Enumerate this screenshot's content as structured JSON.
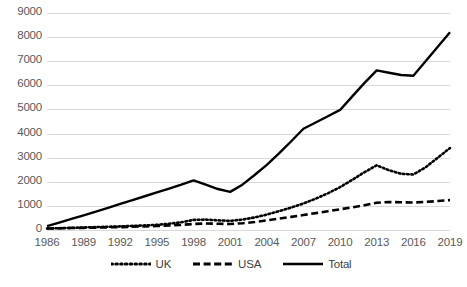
{
  "chart_data": {
    "type": "line",
    "title": "",
    "xlabel": "",
    "ylabel": "",
    "x": [
      1986,
      1987,
      1988,
      1989,
      1990,
      1991,
      1992,
      1993,
      1994,
      1995,
      1996,
      1997,
      1998,
      1999,
      2000,
      2001,
      2002,
      2003,
      2004,
      2005,
      2006,
      2007,
      2008,
      2009,
      2010,
      2011,
      2012,
      2013,
      2014,
      2015,
      2016,
      2017,
      2018,
      2019
    ],
    "xticks": [
      "1986",
      "1989",
      "1992",
      "1995",
      "1998",
      "2001",
      "2004",
      "2007",
      "2010",
      "2013",
      "2016",
      "2019"
    ],
    "yticks": [
      "0",
      "1000",
      "2000",
      "3000",
      "4000",
      "5000",
      "6000",
      "7000",
      "8000",
      "9000"
    ],
    "ylim": [
      0,
      9000
    ],
    "ytick_step": 1000,
    "grid": true,
    "legend_position": "bottom",
    "series": [
      {
        "name": "UK",
        "style": "dotted",
        "color": "#000000",
        "values": [
          60,
          75,
          90,
          105,
          120,
          135,
          150,
          170,
          190,
          215,
          260,
          320,
          420,
          430,
          400,
          380,
          430,
          520,
          640,
          780,
          930,
          1100,
          1300,
          1520,
          1780,
          2080,
          2400,
          2680,
          2480,
          2330,
          2300,
          2600,
          3000,
          3400
        ]
      },
      {
        "name": "USA",
        "style": "dashed",
        "color": "#000000",
        "values": [
          60,
          70,
          80,
          90,
          100,
          110,
          120,
          135,
          150,
          165,
          185,
          210,
          250,
          270,
          260,
          250,
          280,
          330,
          400,
          470,
          545,
          620,
          700,
          780,
          860,
          940,
          1030,
          1130,
          1160,
          1150,
          1140,
          1165,
          1200,
          1240
        ]
      },
      {
        "name": "Total",
        "style": "solid",
        "color": "#000000",
        "values": [
          160,
          310,
          460,
          610,
          760,
          920,
          1080,
          1240,
          1400,
          1560,
          1720,
          1880,
          2060,
          1880,
          1700,
          1580,
          1880,
          2280,
          2700,
          3180,
          3680,
          4200,
          4460,
          4720,
          4980,
          5540,
          6100,
          6620,
          6520,
          6430,
          6400,
          7000,
          7600,
          8200
        ]
      }
    ]
  },
  "legend": {
    "items": [
      {
        "label": "UK",
        "icon": "dotted-line-swatch"
      },
      {
        "label": "USA",
        "icon": "dashed-line-swatch"
      },
      {
        "label": "Total",
        "icon": "solid-line-swatch"
      }
    ]
  }
}
